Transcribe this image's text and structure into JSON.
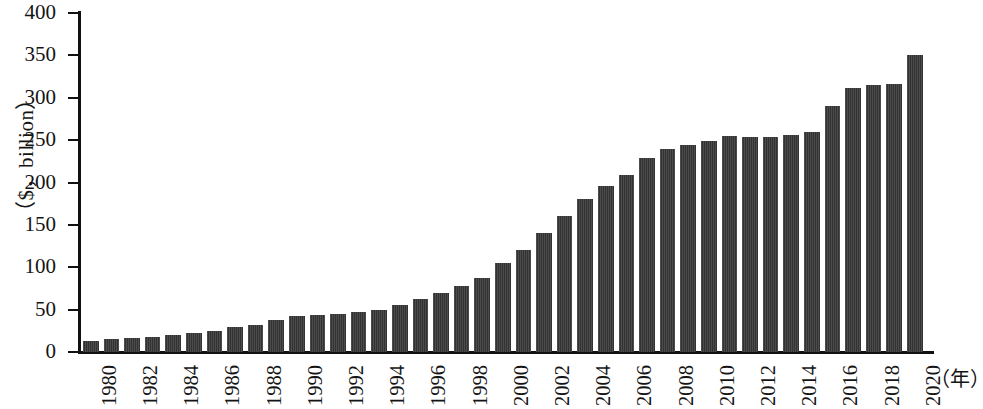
{
  "chart_data": {
    "type": "bar",
    "title": "",
    "subtitle": "",
    "xlabel": "（年）",
    "ylabel": "（$，billion）",
    "ylim": [
      0,
      400
    ],
    "xlim_years": [
      1980,
      2020
    ],
    "ytick_values": [
      0,
      50,
      100,
      150,
      200,
      250,
      300,
      350,
      400
    ],
    "ytick_labels": [
      "0",
      "50",
      "100",
      "150",
      "200",
      "250",
      "300",
      "350",
      "400"
    ],
    "xtick_labels": [
      "1980",
      "1982",
      "1984",
      "1986",
      "1988",
      "1990",
      "1992",
      "1994",
      "1996",
      "1998",
      "2000",
      "2002",
      "2004",
      "2006",
      "2008",
      "2010",
      "2012",
      "2014",
      "2016",
      "2018",
      "2020"
    ],
    "xtick_step_years": 2,
    "grid": false,
    "legend": false,
    "bar_color": "#383838",
    "axis_color": "#111111",
    "background_color": "#ffffff",
    "categories": [
      "1980",
      "1981",
      "1982",
      "1983",
      "1984",
      "1985",
      "1986",
      "1987",
      "1988",
      "1989",
      "1990",
      "1991",
      "1992",
      "1993",
      "1994",
      "1995",
      "1996",
      "1997",
      "1998",
      "1999",
      "2000",
      "2001",
      "2002",
      "2003",
      "2004",
      "2005",
      "2006",
      "2007",
      "2008",
      "2009",
      "2010",
      "2011",
      "2012",
      "2013",
      "2014",
      "2015",
      "2016",
      "2017",
      "2018",
      "2019",
      "2020"
    ],
    "values": [
      13,
      15,
      16,
      18,
      20,
      22,
      25,
      29,
      32,
      38,
      42,
      44,
      45,
      47,
      49,
      55,
      62,
      70,
      78,
      87,
      105,
      120,
      141,
      160,
      180,
      196,
      209,
      229,
      239,
      244,
      249,
      255,
      254,
      254,
      256,
      260,
      290,
      312,
      315,
      316,
      350
    ],
    "values_note": "Estimated from bar heights against the 0–400 axis"
  },
  "axis": {
    "y_title": "（$，billion）",
    "x_title": "（年）"
  }
}
